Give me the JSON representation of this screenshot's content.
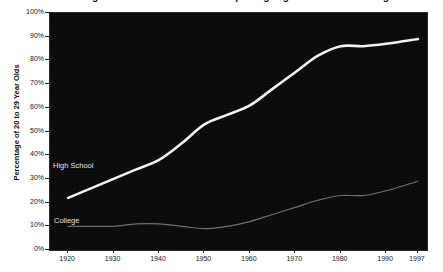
{
  "chart_data": {
    "type": "line",
    "title": "Percentage of 20 to 29 Year Olds Completing High School and College",
    "xlabel": "",
    "ylabel": "Percentage of 20 to 29 Year Olds",
    "grid": false,
    "legend_position": "inline-series-labels",
    "xlim": [
      1916,
      1999
    ],
    "ylim": [
      0,
      100
    ],
    "x": [
      1920,
      1930,
      1940,
      1950,
      1960,
      1970,
      1980,
      1990,
      1997
    ],
    "xtick_labels": [
      "1920",
      "1930",
      "1940",
      "1950",
      "1960",
      "1970",
      "1980",
      "1990",
      "1997"
    ],
    "ytick_labels": [
      "0%",
      "10%",
      "20%",
      "30%",
      "40%",
      "50%",
      "60%",
      "70%",
      "80%",
      "90%",
      "100%"
    ],
    "ytick_values": [
      0,
      10,
      20,
      30,
      40,
      50,
      60,
      70,
      80,
      90,
      100
    ],
    "series": [
      {
        "name": "High School",
        "color": "#f2f2f2",
        "x": [
          1920,
          1925,
          1930,
          1935,
          1940,
          1945,
          1950,
          1955,
          1960,
          1965,
          1970,
          1975,
          1980,
          1985,
          1990,
          1997
        ],
        "values": [
          22,
          26,
          30,
          34,
          38,
          45,
          53,
          57,
          61,
          68,
          75,
          82,
          86,
          86,
          87,
          89
        ]
      },
      {
        "name": "College",
        "color": "#707070",
        "x": [
          1920,
          1925,
          1930,
          1935,
          1940,
          1945,
          1950,
          1955,
          1960,
          1965,
          1970,
          1975,
          1980,
          1985,
          1990,
          1997
        ],
        "values": [
          10,
          10,
          10,
          11,
          11,
          10,
          9,
          10,
          12,
          15,
          18,
          21,
          23,
          23,
          25,
          29
        ]
      }
    ],
    "annotations": [
      {
        "text": "High School",
        "x": 1922,
        "y": 34
      },
      {
        "text": "College",
        "x": 1922,
        "y": 13
      }
    ]
  },
  "axes": {
    "y_title": "Percentage of 20 to 29 Year Olds"
  }
}
